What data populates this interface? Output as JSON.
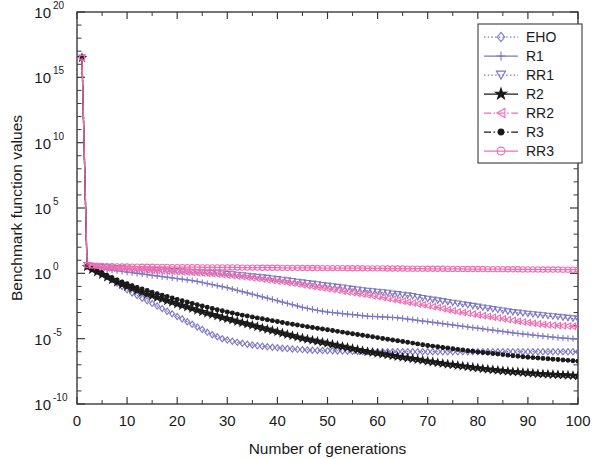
{
  "chart_data": {
    "type": "line",
    "title": "",
    "xlabel": "Number of generations",
    "ylabel": "Benchmark function values",
    "xlim": [
      0,
      100
    ],
    "ylim_log10": [
      -10,
      20
    ],
    "yscale": "log",
    "grid": false,
    "legend_position": "top-right",
    "x_ticks": [
      "0",
      "10",
      "20",
      "30",
      "40",
      "50",
      "60",
      "70",
      "80",
      "90",
      "100"
    ],
    "x_tick_values": [
      0,
      10,
      20,
      30,
      40,
      50,
      60,
      70,
      80,
      90,
      100
    ],
    "y_ticks": [
      "10^20",
      "10^15",
      "10^10",
      "10^5",
      "10^0",
      "10^-5",
      "10^-10"
    ],
    "y_tick_mantissa": [
      "10",
      "10",
      "10",
      "10",
      "10",
      "10",
      "10"
    ],
    "y_tick_exponents": [
      "20",
      "15",
      "10",
      "5",
      "0",
      "-5",
      "-10"
    ],
    "y_tick_values_log10": [
      20,
      15,
      10,
      5,
      0,
      -5,
      -10
    ],
    "x": [
      1,
      2,
      3,
      4,
      5,
      6,
      7,
      8,
      9,
      10,
      11,
      12,
      13,
      14,
      15,
      16,
      17,
      18,
      19,
      20,
      21,
      22,
      23,
      24,
      25,
      26,
      27,
      28,
      29,
      30,
      31,
      32,
      33,
      34,
      35,
      36,
      37,
      38,
      39,
      40,
      41,
      42,
      43,
      44,
      45,
      46,
      47,
      48,
      49,
      50,
      51,
      52,
      53,
      54,
      55,
      56,
      57,
      58,
      59,
      60,
      61,
      62,
      63,
      64,
      65,
      66,
      67,
      68,
      69,
      70,
      71,
      72,
      73,
      74,
      75,
      76,
      77,
      78,
      79,
      80,
      81,
      82,
      83,
      84,
      85,
      86,
      87,
      88,
      89,
      90,
      91,
      92,
      93,
      94,
      95,
      96,
      97,
      98,
      99,
      100
    ],
    "series": [
      {
        "name": "EHO",
        "color": "#7B76C4",
        "marker": "diamond",
        "linestyle": "dotted",
        "values_log10": [
          16.5,
          0.55,
          0.35,
          0.2,
          0.0,
          -0.25,
          -0.5,
          -0.75,
          -1.0,
          -1.25,
          -1.5,
          -1.7,
          -1.9,
          -2.1,
          -2.3,
          -2.5,
          -2.7,
          -2.9,
          -3.1,
          -3.3,
          -3.5,
          -3.7,
          -3.9,
          -4.1,
          -4.3,
          -4.5,
          -4.7,
          -4.85,
          -5.0,
          -5.1,
          -5.2,
          -5.28,
          -5.35,
          -5.42,
          -5.48,
          -5.54,
          -5.58,
          -5.62,
          -5.66,
          -5.7,
          -5.73,
          -5.76,
          -5.79,
          -5.82,
          -5.84,
          -5.86,
          -5.88,
          -5.9,
          -5.91,
          -5.92,
          -5.93,
          -5.94,
          -5.95,
          -5.96,
          -5.97,
          -5.975,
          -5.98,
          -5.985,
          -5.99,
          -5.995,
          -6.0,
          -6.0,
          -6.0,
          -6.0,
          -6.0,
          -6.0,
          -6.0,
          -6.0,
          -6.0,
          -6.0,
          -6.0,
          -6.0,
          -6.0,
          -6.0,
          -6.0,
          -6.0,
          -6.0,
          -6.0,
          -6.0,
          -6.0,
          -6.0,
          -6.0,
          -6.0,
          -6.0,
          -6.0,
          -6.0,
          -6.0,
          -6.0,
          -6.0,
          -6.0,
          -6.0,
          -6.0,
          -6.0,
          -6.0,
          -6.0,
          -6.0,
          -6.0,
          -6.0,
          -6.0,
          -6.0
        ]
      },
      {
        "name": "R1",
        "color": "#7B76C4",
        "marker": "plus",
        "linestyle": "solid",
        "values_log10": [
          16.5,
          0.6,
          0.45,
          0.4,
          0.35,
          0.3,
          0.25,
          0.2,
          0.15,
          0.1,
          0.05,
          0.0,
          -0.05,
          -0.1,
          -0.15,
          -0.2,
          -0.25,
          -0.3,
          -0.35,
          -0.4,
          -0.45,
          -0.5,
          -0.55,
          -0.62,
          -0.7,
          -0.78,
          -0.86,
          -0.94,
          -1.02,
          -1.1,
          -1.2,
          -1.3,
          -1.4,
          -1.5,
          -1.6,
          -1.7,
          -1.8,
          -1.9,
          -2.0,
          -2.1,
          -2.2,
          -2.3,
          -2.4,
          -2.5,
          -2.6,
          -2.68,
          -2.76,
          -2.84,
          -2.9,
          -2.96,
          -3.0,
          -3.04,
          -3.08,
          -3.12,
          -3.16,
          -3.2,
          -3.24,
          -3.28,
          -3.3,
          -3.32,
          -3.34,
          -3.36,
          -3.38,
          -3.4,
          -3.45,
          -3.5,
          -3.55,
          -3.6,
          -3.65,
          -3.7,
          -3.75,
          -3.8,
          -3.85,
          -3.9,
          -3.95,
          -4.0,
          -4.05,
          -4.1,
          -4.15,
          -4.2,
          -4.25,
          -4.3,
          -4.35,
          -4.4,
          -4.45,
          -4.5,
          -4.55,
          -4.6,
          -4.64,
          -4.68,
          -4.72,
          -4.76,
          -4.8,
          -4.84,
          -4.88,
          -4.92,
          -4.95,
          -4.98,
          -5.0,
          -5.02
        ]
      },
      {
        "name": "RR1",
        "color": "#7B76C4",
        "marker": "triangle-down",
        "linestyle": "dotted",
        "values_log10": [
          16.5,
          0.62,
          0.55,
          0.5,
          0.48,
          0.45,
          0.43,
          0.4,
          0.38,
          0.36,
          0.34,
          0.32,
          0.3,
          0.28,
          0.26,
          0.24,
          0.22,
          0.2,
          0.18,
          0.16,
          0.14,
          0.12,
          0.1,
          0.08,
          0.06,
          0.04,
          0.02,
          0.0,
          -0.02,
          -0.05,
          -0.08,
          -0.12,
          -0.16,
          -0.2,
          -0.24,
          -0.28,
          -0.32,
          -0.36,
          -0.4,
          -0.45,
          -0.5,
          -0.55,
          -0.6,
          -0.65,
          -0.7,
          -0.75,
          -0.8,
          -0.85,
          -0.9,
          -0.95,
          -1.0,
          -1.05,
          -1.1,
          -1.15,
          -1.2,
          -1.25,
          -1.3,
          -1.34,
          -1.38,
          -1.42,
          -1.46,
          -1.5,
          -1.55,
          -1.6,
          -1.65,
          -1.7,
          -1.75,
          -1.82,
          -1.9,
          -1.96,
          -2.02,
          -2.08,
          -2.14,
          -2.2,
          -2.26,
          -2.32,
          -2.38,
          -2.44,
          -2.5,
          -2.56,
          -2.62,
          -2.68,
          -2.74,
          -2.8,
          -2.86,
          -2.92,
          -2.98,
          -3.02,
          -3.06,
          -3.1,
          -3.14,
          -3.18,
          -3.22,
          -3.26,
          -3.3,
          -3.34,
          -3.38,
          -3.42,
          -3.46,
          -3.5
        ]
      },
      {
        "name": "R2",
        "color": "#1a1a1a",
        "marker": "star",
        "linestyle": "solid",
        "values_log10": [
          16.5,
          0.5,
          0.3,
          0.1,
          -0.1,
          -0.3,
          -0.5,
          -0.68,
          -0.85,
          -1.0,
          -1.15,
          -1.3,
          -1.45,
          -1.6,
          -1.72,
          -1.85,
          -1.97,
          -2.1,
          -2.22,
          -2.34,
          -2.46,
          -2.58,
          -2.7,
          -2.82,
          -2.94,
          -3.05,
          -3.16,
          -3.27,
          -3.38,
          -3.48,
          -3.58,
          -3.68,
          -3.78,
          -3.88,
          -3.98,
          -4.08,
          -4.18,
          -4.28,
          -4.38,
          -4.48,
          -4.58,
          -4.68,
          -4.78,
          -4.88,
          -4.96,
          -5.04,
          -5.12,
          -5.2,
          -5.28,
          -5.36,
          -5.44,
          -5.52,
          -5.6,
          -5.68,
          -5.76,
          -5.84,
          -5.92,
          -6.0,
          -6.06,
          -6.12,
          -6.18,
          -6.24,
          -6.3,
          -6.36,
          -6.42,
          -6.48,
          -6.54,
          -6.6,
          -6.66,
          -6.72,
          -6.78,
          -6.84,
          -6.9,
          -6.95,
          -7.0,
          -7.05,
          -7.1,
          -7.15,
          -7.2,
          -7.25,
          -7.3,
          -7.34,
          -7.38,
          -7.42,
          -7.46,
          -7.5,
          -7.53,
          -7.56,
          -7.59,
          -7.62,
          -7.65,
          -7.68,
          -7.7,
          -7.72,
          -7.74,
          -7.76,
          -7.78,
          -7.8,
          -7.82,
          -7.85
        ]
      },
      {
        "name": "RR2",
        "color": "#F06EB0",
        "marker": "triangle-left",
        "linestyle": "dashdot",
        "values_log10": [
          16.5,
          0.6,
          0.52,
          0.48,
          0.45,
          0.42,
          0.4,
          0.38,
          0.35,
          0.33,
          0.31,
          0.29,
          0.27,
          0.25,
          0.23,
          0.21,
          0.19,
          0.17,
          0.15,
          0.13,
          0.11,
          0.09,
          0.07,
          0.05,
          0.02,
          0.0,
          -0.03,
          -0.06,
          -0.1,
          -0.14,
          -0.18,
          -0.22,
          -0.26,
          -0.3,
          -0.35,
          -0.4,
          -0.45,
          -0.5,
          -0.55,
          -0.6,
          -0.65,
          -0.7,
          -0.76,
          -0.82,
          -0.88,
          -0.94,
          -1.0,
          -1.06,
          -1.12,
          -1.18,
          -1.24,
          -1.3,
          -1.36,
          -1.42,
          -1.48,
          -1.54,
          -1.6,
          -1.66,
          -1.72,
          -1.78,
          -1.85,
          -1.92,
          -1.99,
          -2.06,
          -2.13,
          -2.2,
          -2.27,
          -2.34,
          -2.41,
          -2.48,
          -2.55,
          -2.62,
          -2.7,
          -2.78,
          -2.86,
          -2.94,
          -3.0,
          -3.06,
          -3.12,
          -3.18,
          -3.24,
          -3.3,
          -3.36,
          -3.42,
          -3.48,
          -3.54,
          -3.6,
          -3.66,
          -3.72,
          -3.77,
          -3.82,
          -3.87,
          -3.91,
          -3.95,
          -3.98,
          -4.0,
          -4.02,
          -4.04,
          -4.06,
          -4.08
        ]
      },
      {
        "name": "R3",
        "color": "#1a1a1a",
        "marker": "dot",
        "linestyle": "dashdot",
        "values_log10": [
          16.5,
          0.52,
          0.34,
          0.18,
          0.02,
          -0.16,
          -0.34,
          -0.5,
          -0.66,
          -0.8,
          -0.94,
          -1.08,
          -1.2,
          -1.32,
          -1.44,
          -1.56,
          -1.67,
          -1.78,
          -1.89,
          -2.0,
          -2.1,
          -2.2,
          -2.3,
          -2.4,
          -2.5,
          -2.6,
          -2.69,
          -2.78,
          -2.87,
          -2.96,
          -3.04,
          -3.12,
          -3.2,
          -3.27,
          -3.34,
          -3.41,
          -3.48,
          -3.55,
          -3.62,
          -3.69,
          -3.76,
          -3.83,
          -3.9,
          -3.96,
          -4.02,
          -4.08,
          -4.14,
          -4.2,
          -4.26,
          -4.32,
          -4.38,
          -4.44,
          -4.5,
          -4.56,
          -4.62,
          -4.68,
          -4.74,
          -4.8,
          -4.86,
          -4.92,
          -4.98,
          -5.04,
          -5.1,
          -5.16,
          -5.22,
          -5.28,
          -5.34,
          -5.4,
          -5.46,
          -5.52,
          -5.57,
          -5.62,
          -5.67,
          -5.72,
          -5.77,
          -5.82,
          -5.87,
          -5.92,
          -5.97,
          -6.02,
          -6.06,
          -6.1,
          -6.14,
          -6.18,
          -6.22,
          -6.26,
          -6.3,
          -6.34,
          -6.38,
          -6.42,
          -6.45,
          -6.48,
          -6.51,
          -6.54,
          -6.57,
          -6.6,
          -6.63,
          -6.66,
          -6.69,
          -6.72
        ]
      },
      {
        "name": "RR3",
        "color": "#F06EB0",
        "marker": "circle",
        "linestyle": "solid",
        "values_log10": [
          16.5,
          0.65,
          0.6,
          0.58,
          0.56,
          0.55,
          0.54,
          0.53,
          0.52,
          0.52,
          0.51,
          0.51,
          0.5,
          0.5,
          0.5,
          0.49,
          0.49,
          0.49,
          0.48,
          0.48,
          0.48,
          0.47,
          0.47,
          0.47,
          0.46,
          0.46,
          0.46,
          0.46,
          0.45,
          0.45,
          0.45,
          0.45,
          0.44,
          0.44,
          0.44,
          0.44,
          0.43,
          0.43,
          0.43,
          0.43,
          0.42,
          0.42,
          0.42,
          0.42,
          0.41,
          0.41,
          0.41,
          0.41,
          0.4,
          0.4,
          0.4,
          0.4,
          0.4,
          0.39,
          0.39,
          0.39,
          0.39,
          0.38,
          0.38,
          0.38,
          0.38,
          0.37,
          0.37,
          0.37,
          0.37,
          0.36,
          0.36,
          0.36,
          0.36,
          0.35,
          0.35,
          0.35,
          0.35,
          0.34,
          0.34,
          0.34,
          0.34,
          0.33,
          0.33,
          0.33,
          0.33,
          0.32,
          0.32,
          0.32,
          0.32,
          0.31,
          0.31,
          0.31,
          0.3,
          0.3,
          0.3,
          0.3,
          0.29,
          0.29,
          0.29,
          0.29,
          0.28,
          0.28,
          0.28,
          0.28
        ]
      }
    ]
  },
  "legend": {
    "entries": [
      {
        "label": "EHO"
      },
      {
        "label": "R1"
      },
      {
        "label": "RR1"
      },
      {
        "label": "RR2_placeholder"
      }
    ],
    "labels": [
      "EHO",
      "R1",
      "RR1",
      "R2",
      "RR2",
      "R3",
      "RR3"
    ]
  },
  "axes": {
    "xlabel": "Number of generations",
    "ylabel": "Benchmark function values"
  },
  "colors": {
    "purple": "#7B76C4",
    "pink": "#F06EB0",
    "black": "#1a1a1a",
    "axis": "#3a3a3a",
    "background": "#ffffff"
  }
}
